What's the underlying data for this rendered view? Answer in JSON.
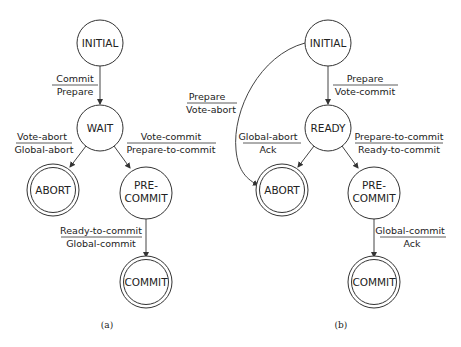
{
  "diagrams": [
    {
      "caption": "(a)",
      "states": {
        "initial": "INITIAL",
        "wait": "WAIT",
        "abort": "ABORT",
        "precommit_line1": "PRE-",
        "precommit_line2": "COMMIT",
        "commit": "COMMIT"
      },
      "transitions": {
        "initial_to_wait": {
          "input": "Commit",
          "output": "Prepare"
        },
        "wait_to_abort": {
          "input": "Vote-abort",
          "output": "Global-abort"
        },
        "wait_to_precommit": {
          "input": "Vote-commit",
          "output": "Prepare-to-commit"
        },
        "precommit_to_commit": {
          "input": "Ready-to-commit",
          "output": "Global-commit"
        }
      }
    },
    {
      "caption": "(b)",
      "states": {
        "initial": "INITIAL",
        "ready": "READY",
        "abort": "ABORT",
        "precommit_line1": "PRE-",
        "precommit_line2": "COMMIT",
        "commit": "COMMIT"
      },
      "transitions": {
        "initial_to_ready": {
          "input": "Prepare",
          "output": "Vote-commit"
        },
        "initial_to_abort": {
          "input": "Prepare",
          "output": "Vote-abort"
        },
        "ready_to_abort": {
          "input": "Global-abort",
          "output": "Ack"
        },
        "ready_to_precommit": {
          "input": "Prepare-to-commit",
          "output": "Ready-to-commit"
        },
        "precommit_to_commit": {
          "input": "Global-commit",
          "output": "Ack"
        }
      }
    }
  ]
}
